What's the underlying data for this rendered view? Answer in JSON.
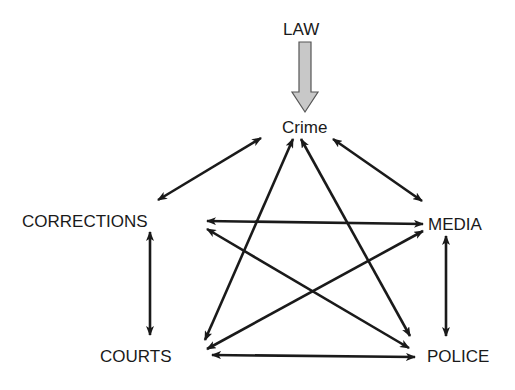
{
  "diagram": {
    "colors": {
      "line": "#1a1a1a",
      "law_arrow_fill": "#c8c8c8",
      "law_arrow_stroke": "#555555",
      "background": "#ffffff"
    },
    "nodes": [
      {
        "id": "law",
        "label": "LAW",
        "x": 283,
        "y": 20
      },
      {
        "id": "crime",
        "label": "Crime",
        "x": 282,
        "y": 118
      },
      {
        "id": "corrections",
        "label": "CORRECTIONS",
        "x": 22,
        "y": 212
      },
      {
        "id": "media",
        "label": "MEDIA",
        "x": 428,
        "y": 215
      },
      {
        "id": "courts",
        "label": "COURTS",
        "x": 100,
        "y": 347
      },
      {
        "id": "police",
        "label": "POLICE",
        "x": 427,
        "y": 347
      }
    ],
    "law_to_crime": {
      "from": "law",
      "to": "crime",
      "style": "hollow-block-arrow"
    },
    "edges": [
      {
        "from": "crime",
        "to": "corrections",
        "bidirectional": true,
        "x1": 261,
        "y1": 138,
        "x2": 158,
        "y2": 200
      },
      {
        "from": "crime",
        "to": "media",
        "bidirectional": true,
        "x1": 333,
        "y1": 139,
        "x2": 422,
        "y2": 201
      },
      {
        "from": "crime",
        "to": "courts",
        "bidirectional": true,
        "x1": 293,
        "y1": 139,
        "x2": 205,
        "y2": 340
      },
      {
        "from": "crime",
        "to": "police",
        "bidirectional": true,
        "x1": 301,
        "y1": 139,
        "x2": 410,
        "y2": 336
      },
      {
        "from": "corrections",
        "to": "media",
        "bidirectional": true,
        "x1": 207,
        "y1": 221,
        "x2": 423,
        "y2": 224
      },
      {
        "from": "corrections",
        "to": "police",
        "bidirectional": true,
        "x1": 207,
        "y1": 229,
        "x2": 409,
        "y2": 348
      },
      {
        "from": "media",
        "to": "courts",
        "bidirectional": true,
        "x1": 423,
        "y1": 231,
        "x2": 207,
        "y2": 349
      },
      {
        "from": "courts",
        "to": "police",
        "bidirectional": true,
        "x1": 212,
        "y1": 355,
        "x2": 415,
        "y2": 357
      },
      {
        "from": "corrections",
        "to": "courts",
        "bidirectional": true,
        "x1": 150,
        "y1": 232,
        "x2": 150,
        "y2": 335
      },
      {
        "from": "media",
        "to": "police",
        "bidirectional": true,
        "x1": 446,
        "y1": 236,
        "x2": 446,
        "y2": 336
      }
    ]
  }
}
